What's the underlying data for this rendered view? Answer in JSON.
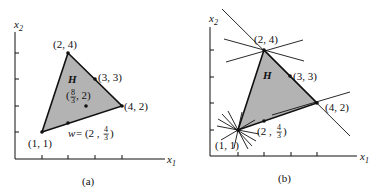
{
  "panels": [
    {
      "id": "a",
      "caption": "(a)",
      "axis_x_label": "x",
      "axis_x_sub": "1",
      "axis_y_label": "x",
      "axis_y_sub": "2",
      "region_label": "H",
      "vertices": [
        {
          "label": "(2, 4)",
          "x": 2,
          "y": 4
        },
        {
          "label": "(4, 2)",
          "x": 4,
          "y": 2
        },
        {
          "label": "(1, 1)",
          "x": 1,
          "y": 1
        }
      ],
      "points": [
        {
          "label": "(3, 3)",
          "x": 3,
          "y": 3
        },
        {
          "label_prefix": "(",
          "frac_num": "8",
          "frac_den": "3",
          "label_suffix": ", 2)",
          "x": 2.667,
          "y": 2
        },
        {
          "label_prefix": "w = (2 , ",
          "frac_num": "4",
          "frac_den": "3",
          "label_suffix": ")",
          "x": 2,
          "y": 1.333
        }
      ]
    },
    {
      "id": "b",
      "caption": "(b)",
      "axis_x_label": "x",
      "axis_x_sub": "1",
      "axis_y_label": "x",
      "axis_y_sub": "2",
      "region_label": "H",
      "vertices": [
        {
          "label": "(2, 4)",
          "x": 2,
          "y": 4
        },
        {
          "label": "(4, 2)",
          "x": 4,
          "y": 2
        },
        {
          "label": "(1, 1)",
          "x": 1,
          "y": 1
        }
      ],
      "points": [
        {
          "label": "(3, 3)",
          "x": 3,
          "y": 3
        },
        {
          "label_prefix": "(2 , ",
          "frac_num": "4",
          "frac_den": "3",
          "label_suffix": ")",
          "x": 2,
          "y": 1.333
        }
      ],
      "supporting_lines_note": "lines drawn through vertices (2,4), (4,2) and a fan of lines through (1,1)"
    }
  ],
  "colors": {
    "fill": "#b3b3b3",
    "stroke": "#111111",
    "background": "#ffffff"
  }
}
